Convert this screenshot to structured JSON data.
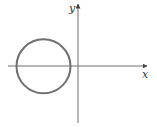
{
  "diagram": {
    "type": "coordinate-plane-circle",
    "axes": {
      "x_label": "x",
      "y_label": "y",
      "color": "#6e6e6e"
    },
    "circle": {
      "description": "circle entirely in left half-plane, centered on x-axis",
      "color": "#707070"
    }
  }
}
